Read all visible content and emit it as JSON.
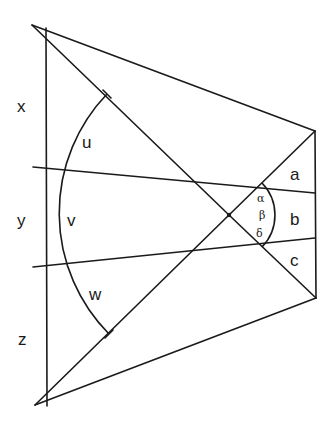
{
  "diagram": {
    "type": "geometry-figure",
    "left_segment_labels": {
      "x": "x",
      "y": "y",
      "z": "z"
    },
    "arc_labels": {
      "u": "u",
      "v": "v",
      "w": "w"
    },
    "right_segment_labels": {
      "a": "a",
      "b": "b",
      "c": "c"
    },
    "angle_labels": {
      "alpha": "α",
      "beta": "β",
      "delta": "δ"
    },
    "colors": {
      "line": "#1a1a1a",
      "background": "#ffffff"
    }
  }
}
